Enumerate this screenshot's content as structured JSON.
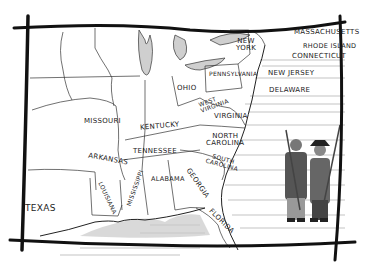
{
  "map": {
    "style": "hand-drawn ink sketch",
    "colors": {
      "ink": "#1a1a1a",
      "border": "#111111",
      "water": "#b9b9b9",
      "paper": "#ffffff"
    },
    "states": [
      {
        "name": "NEW YORK",
        "lines": [
          "NEW",
          "YORK"
        ],
        "x": 237,
        "y": 38
      },
      {
        "name": "MASSACHUSETTS",
        "x": 296,
        "y": 31
      },
      {
        "name": "RHODE ISLAND",
        "x": 304,
        "y": 44
      },
      {
        "name": "CONNECTICUT",
        "x": 294,
        "y": 54
      },
      {
        "name": "PENNSYLVANIA",
        "x": 210,
        "y": 71
      },
      {
        "name": "NEW JERSEY",
        "x": 271,
        "y": 71
      },
      {
        "name": "DELAWARE",
        "x": 270,
        "y": 88
      },
      {
        "name": "OHIO",
        "x": 177,
        "y": 86
      },
      {
        "name": "WEST VIRGINIA",
        "lines": [
          "WEST",
          "VIRGINIA"
        ],
        "x": 198,
        "y": 98
      },
      {
        "name": "VIRGINIA",
        "x": 215,
        "y": 114
      },
      {
        "name": "MISSOURI",
        "x": 85,
        "y": 119
      },
      {
        "name": "KENTUCKY",
        "x": 141,
        "y": 124
      },
      {
        "name": "NORTH CAROLINA",
        "lines": [
          "NORTH",
          "CAROLINA"
        ],
        "x": 205,
        "y": 134
      },
      {
        "name": "TENNESSEE",
        "x": 133,
        "y": 150
      },
      {
        "name": "SOUTH CAROLINA",
        "lines": [
          "SOUTH",
          "CAROLINA"
        ],
        "x": 205,
        "y": 157
      },
      {
        "name": "ARKANSAS",
        "x": 90,
        "y": 156
      },
      {
        "name": "MISSISSIPPI",
        "x": 122,
        "y": 178
      },
      {
        "name": "ALABAMA",
        "x": 152,
        "y": 176
      },
      {
        "name": "GEORGIA",
        "x": 185,
        "y": 175
      },
      {
        "name": "LOUISIANA",
        "x": 98,
        "y": 190
      },
      {
        "name": "TEXAS",
        "x": 27,
        "y": 205
      },
      {
        "name": "FLORIDA",
        "x": 210,
        "y": 212
      }
    ],
    "figures": [
      {
        "description": "colonial soldier with musket",
        "position": "right"
      },
      {
        "description": "colonial soldier with musket and tricorn hat",
        "position": "right"
      }
    ]
  }
}
